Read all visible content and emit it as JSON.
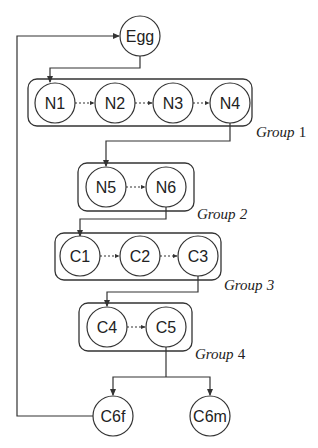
{
  "diagram": {
    "type": "flow-diagram",
    "nodes": {
      "egg": {
        "label": "Egg",
        "cx": 140,
        "cy": 36
      },
      "n1": {
        "label": "N1",
        "cx": 55,
        "cy": 103
      },
      "n2": {
        "label": "N2",
        "cx": 115,
        "cy": 103
      },
      "n3": {
        "label": "N3",
        "cx": 173,
        "cy": 103
      },
      "n4": {
        "label": "N4",
        "cx": 230,
        "cy": 103
      },
      "n5": {
        "label": "N5",
        "cx": 106,
        "cy": 187
      },
      "n6": {
        "label": "N6",
        "cx": 166,
        "cy": 187
      },
      "c1": {
        "label": "C1",
        "cx": 80,
        "cy": 256
      },
      "c2": {
        "label": "C2",
        "cx": 140,
        "cy": 256
      },
      "c3": {
        "label": "C3",
        "cx": 198,
        "cy": 256
      },
      "c4": {
        "label": "C4",
        "cx": 107,
        "cy": 327
      },
      "c5": {
        "label": "C5",
        "cx": 166,
        "cy": 327
      },
      "c6f": {
        "label": "C6f",
        "cx": 113,
        "cy": 416
      },
      "c6m": {
        "label": "C6m",
        "cx": 210,
        "cy": 416
      }
    },
    "groups": {
      "g1": {
        "word": "Group",
        "num": "1"
      },
      "g2": {
        "word": "Group",
        "num": "2"
      },
      "g3": {
        "word": "Group",
        "num": "3"
      },
      "g4": {
        "word": "Group",
        "num": "4"
      }
    },
    "edges": [
      {
        "from": "Egg",
        "to": "N1",
        "style": "solid"
      },
      {
        "from": "N1",
        "to": "N2",
        "style": "dotted"
      },
      {
        "from": "N2",
        "to": "N3",
        "style": "dotted"
      },
      {
        "from": "N3",
        "to": "N4",
        "style": "dotted"
      },
      {
        "from": "N4",
        "to": "N5",
        "style": "solid"
      },
      {
        "from": "N5",
        "to": "N6",
        "style": "dotted"
      },
      {
        "from": "N6",
        "to": "C1",
        "style": "solid"
      },
      {
        "from": "C1",
        "to": "C2",
        "style": "dotted"
      },
      {
        "from": "C2",
        "to": "C3",
        "style": "dotted"
      },
      {
        "from": "C3",
        "to": "C4",
        "style": "solid"
      },
      {
        "from": "C4",
        "to": "C5",
        "style": "dotted"
      },
      {
        "from": "C5",
        "to": "C6f",
        "style": "solid"
      },
      {
        "from": "C5",
        "to": "C6m",
        "style": "solid"
      },
      {
        "from": "C6f",
        "to": "Egg",
        "style": "solid"
      }
    ],
    "colors": {
      "stroke": "#333333",
      "background": "#ffffff"
    }
  }
}
